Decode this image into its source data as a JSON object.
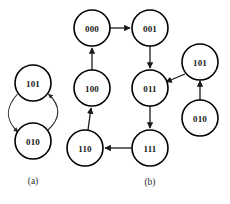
{
  "figure": {
    "background_color": "#ffffff",
    "node_stroke_color": "#000000",
    "edge_color": "#1a1a1a",
    "label_color": "#1a1a1a"
  },
  "panels": [
    {
      "id": "a",
      "caption": "(a)",
      "caption_x": 33,
      "caption_y": 181,
      "nodes": [
        {
          "id": "a-101",
          "label": "101",
          "cx": 33,
          "cy": 83,
          "r": 18
        },
        {
          "id": "a-010",
          "label": "010",
          "cx": 33,
          "cy": 141,
          "r": 18
        }
      ],
      "edges": [
        {
          "from": "101",
          "to": "010",
          "style": "curved-left",
          "directed": true
        },
        {
          "from": "010",
          "to": "101",
          "style": "curved-right",
          "directed": true
        }
      ]
    },
    {
      "id": "b",
      "caption": "(b)",
      "caption_x": 150,
      "caption_y": 182,
      "nodes": [
        {
          "id": "b-000",
          "label": "000",
          "cx": 92,
          "cy": 28,
          "r": 18
        },
        {
          "id": "b-001",
          "label": "001",
          "cx": 150,
          "cy": 28,
          "r": 18
        },
        {
          "id": "b-100",
          "label": "100",
          "cx": 92,
          "cy": 88,
          "r": 18
        },
        {
          "id": "b-011",
          "label": "011",
          "cx": 150,
          "cy": 88,
          "r": 18
        },
        {
          "id": "b-101",
          "label": "101",
          "cx": 200,
          "cy": 62,
          "r": 18
        },
        {
          "id": "b-010",
          "label": "010",
          "cx": 200,
          "cy": 118,
          "r": 18
        },
        {
          "id": "b-110",
          "label": "110",
          "cx": 85,
          "cy": 148,
          "r": 18
        },
        {
          "id": "b-111",
          "label": "111",
          "cx": 150,
          "cy": 148,
          "r": 18
        }
      ],
      "edges": [
        {
          "from": "000",
          "to": "001",
          "style": "straight",
          "directed": true
        },
        {
          "from": "100",
          "to": "000",
          "style": "straight",
          "directed": true
        },
        {
          "from": "001",
          "to": "011",
          "style": "straight",
          "directed": true
        },
        {
          "from": "101",
          "to": "011",
          "style": "straight",
          "directed": true
        },
        {
          "from": "010",
          "to": "101",
          "style": "straight",
          "directed": true
        },
        {
          "from": "011",
          "to": "111",
          "style": "straight",
          "directed": true
        },
        {
          "from": "111",
          "to": "110",
          "style": "straight",
          "directed": true
        },
        {
          "from": "110",
          "to": "100",
          "style": "straight",
          "directed": true
        }
      ]
    }
  ]
}
